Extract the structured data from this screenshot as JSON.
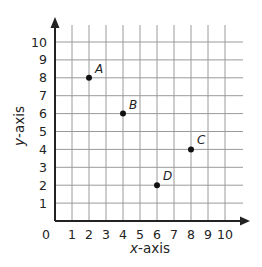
{
  "chart_data": {
    "type": "scatter",
    "title": "",
    "xlabel": "x-axis",
    "ylabel": "y-axis",
    "xlim": [
      0,
      10
    ],
    "ylim": [
      0,
      10
    ],
    "grid": true,
    "x_ticks": [
      "1",
      "2",
      "3",
      "4",
      "5",
      "6",
      "7",
      "8",
      "9",
      "10"
    ],
    "y_ticks": [
      "1",
      "2",
      "3",
      "4",
      "5",
      "6",
      "7",
      "8",
      "9",
      "10"
    ],
    "origin_label": "0",
    "points": [
      {
        "label": "A",
        "x": 2,
        "y": 8
      },
      {
        "label": "B",
        "x": 4,
        "y": 6
      },
      {
        "label": "C",
        "x": 8,
        "y": 4
      },
      {
        "label": "D",
        "x": 6,
        "y": 2
      }
    ]
  },
  "axis_labels": {
    "x_prefix": "x",
    "x_suffix": "-axis",
    "y_prefix": "y",
    "y_suffix": "-axis"
  },
  "colors": {
    "grid": "#9a9a9a",
    "axis": "#222222",
    "point": "#111111"
  }
}
